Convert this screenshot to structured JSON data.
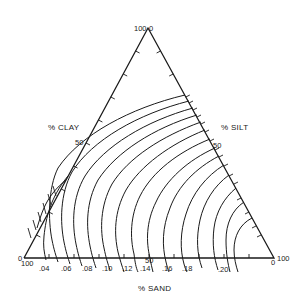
{
  "diagram": {
    "type": "ternary-contour",
    "axes": {
      "clay": {
        "label": "% CLAY",
        "mid_label": "50"
      },
      "silt": {
        "label": "% SILT",
        "mid_label": "50"
      },
      "sand": {
        "label": "% SAND",
        "mid_label": "50"
      }
    },
    "vertices": {
      "top": {
        "left_label": "100",
        "right_label": "0"
      },
      "bottom_left": {
        "top_label": "0",
        "bottom_label": "100"
      },
      "bottom_right": {
        "bottom_label": "0",
        "right_label": "100"
      }
    },
    "contour_labels": [
      ".04",
      ".06",
      ".08",
      ".10",
      ".12",
      ".14",
      ".16",
      ".18",
      ".20"
    ],
    "colors": {
      "ink": "#1a1a1a",
      "background": "#ffffff"
    }
  }
}
